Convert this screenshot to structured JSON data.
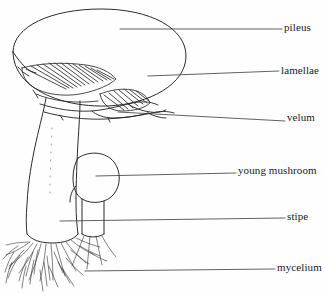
{
  "diagram": {
    "subject": "mushroom",
    "style": "line-drawing",
    "background_color": "#fefefe",
    "line_color": "#2b2b2b",
    "text_color": "#1a1a1a",
    "width": 326,
    "height": 294,
    "labels": [
      {
        "id": "pileus",
        "text": "pileus",
        "leader_from": [
          120,
          29
        ],
        "leader_to": [
          282,
          29
        ],
        "target_part": "cap"
      },
      {
        "id": "lamellae",
        "text": "lamellae",
        "leader_from": [
          148,
          76
        ],
        "leader_to": [
          279,
          71
        ],
        "target_part": "gills"
      },
      {
        "id": "velum",
        "text": "velum",
        "leader_from": [
          118,
          112
        ],
        "leader_to": [
          285,
          121
        ],
        "target_part": "veil-ring"
      },
      {
        "id": "young-mushroom",
        "text": "young mushroom",
        "leader_from": [
          96,
          176
        ],
        "leader_to": [
          236,
          173
        ],
        "target_part": "bud"
      },
      {
        "id": "stipe",
        "text": "stipe",
        "leader_from": [
          60,
          221
        ],
        "leader_to": [
          285,
          218
        ],
        "target_part": "stem"
      },
      {
        "id": "mycelium",
        "text": "mycelium",
        "leader_from": [
          85,
          271
        ],
        "leader_to": [
          275,
          269
        ],
        "target_part": "root-filaments"
      }
    ],
    "parts": {
      "cap_label": "pileus",
      "gills_label": "lamellae",
      "veil_label": "velum",
      "bud_label": "young mushroom",
      "stem_label": "stipe",
      "mycelium_label": "mycelium"
    }
  }
}
